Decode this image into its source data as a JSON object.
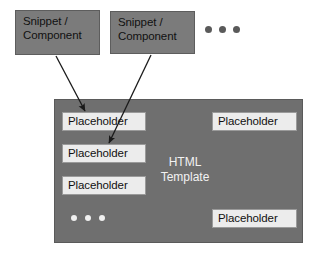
{
  "diagram": {
    "colors": {
      "background": "#ffffff",
      "snippet_fill": "#7b7b7b",
      "snippet_border": "#5d5d5d",
      "template_fill": "#6f6f6f",
      "template_border": "#5a5a5a",
      "placeholder_fill": "#ececec",
      "placeholder_border": "#9a9a9a",
      "text_dark": "#111111",
      "text_light": "#f2f2f2",
      "arrow": "#1a1a1a",
      "dot_dark": "#5a5a5a",
      "dot_light": "#f0f0f0"
    },
    "snippets": [
      {
        "label": "Snippet /\nComponent"
      },
      {
        "label": "Snippet /\nComponent"
      }
    ],
    "top_ellipsis": {
      "label": "...",
      "dot_count": 3
    },
    "template": {
      "label": "HTML\nTemplate",
      "placeholders": [
        {
          "label": "Placeholder",
          "column": "left",
          "row": 1
        },
        {
          "label": "Placeholder",
          "column": "left",
          "row": 2
        },
        {
          "label": "Placeholder",
          "column": "left",
          "row": 3
        },
        {
          "label": "Placeholder",
          "column": "right",
          "row": 1
        },
        {
          "label": "Placeholder",
          "column": "right",
          "row": 4
        }
      ],
      "inner_ellipsis": {
        "label": "...",
        "dot_count": 3
      }
    },
    "arrows": [
      {
        "from": "snippet-1",
        "to": "placeholder-1"
      },
      {
        "from": "snippet-2",
        "to": "placeholder-2"
      }
    ]
  }
}
